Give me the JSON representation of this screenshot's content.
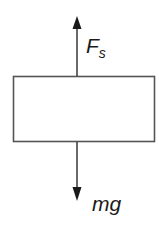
{
  "diagram": {
    "type": "free-body-diagram",
    "body": {
      "shape": "rectangle",
      "x": 13,
      "y": 76,
      "width": 142,
      "height": 66,
      "stroke": "#555555",
      "fill": "#ffffff"
    },
    "forces": [
      {
        "id": "spring-force",
        "direction": "up",
        "label_main": "F",
        "label_sub": "s",
        "from": [
          77,
          76
        ],
        "to": [
          77,
          17
        ]
      },
      {
        "id": "gravity",
        "direction": "down",
        "label_main": "mg",
        "from": [
          77,
          142
        ],
        "to": [
          77,
          200
        ]
      }
    ],
    "colors": {
      "line": "#2a2a2a",
      "box_stroke": "#555555",
      "text": "#1a1a1a",
      "background": "#ffffff"
    }
  }
}
